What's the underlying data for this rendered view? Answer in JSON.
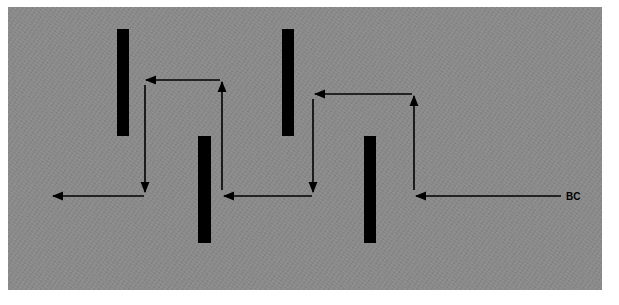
{
  "diagram": {
    "background_color": "#8a8a8a",
    "bar_color": "#000000",
    "arrow_color": "#000000",
    "label": "BC",
    "bars": [
      {
        "name": "bar-1",
        "x": 117,
        "y": 29,
        "w": 12,
        "h": 107
      },
      {
        "name": "bar-2",
        "x": 198,
        "y": 136,
        "w": 13,
        "h": 107
      },
      {
        "name": "bar-3",
        "x": 282,
        "y": 29,
        "w": 12,
        "h": 107
      },
      {
        "name": "bar-4",
        "x": 364,
        "y": 136,
        "w": 12,
        "h": 107
      }
    ],
    "path_description": "Zigzag flow path entering from BC at right, weaving alternately above and below the four barriers, exiting to the left"
  }
}
